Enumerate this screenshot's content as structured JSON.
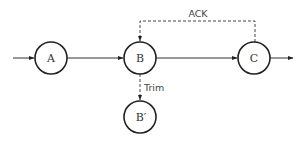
{
  "diagram": {
    "nodes": [
      {
        "id": "A",
        "label": "A"
      },
      {
        "id": "B",
        "label": "B"
      },
      {
        "id": "C",
        "label": "C"
      },
      {
        "id": "Bprime",
        "label": "B′"
      }
    ],
    "edges": [
      {
        "from": "input",
        "to": "A",
        "style": "solid"
      },
      {
        "from": "A",
        "to": "B",
        "style": "solid"
      },
      {
        "from": "B",
        "to": "C",
        "style": "solid"
      },
      {
        "from": "C",
        "to": "output",
        "style": "solid"
      },
      {
        "from": "C",
        "to": "B",
        "style": "dashed",
        "label": "ACK"
      },
      {
        "from": "B",
        "to": "Bprime",
        "style": "dashed",
        "label": "Trim"
      }
    ],
    "labels": {
      "ack": "ACK",
      "trim": "Trim"
    }
  }
}
